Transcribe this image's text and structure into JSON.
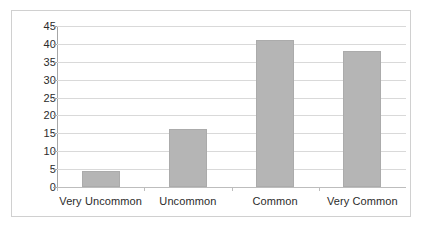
{
  "chart_data": {
    "type": "bar",
    "title": "",
    "subtitle": "",
    "xlabel": "",
    "ylabel": "",
    "categories": [
      "Very Uncommon",
      "Uncommon",
      "Common",
      "Very Common"
    ],
    "values": [
      4.5,
      16.3,
      41,
      38
    ],
    "series": [
      {
        "name": "Series 1",
        "values": [
          4.5,
          16.3,
          41,
          38
        ]
      }
    ],
    "ylim": [
      0,
      45
    ],
    "ytick_labels": [
      "45",
      "40",
      "35",
      "30",
      "25",
      "20",
      "15",
      "10",
      "5",
      "0"
    ],
    "ytick_values": [
      45,
      40,
      35,
      30,
      25,
      20,
      15,
      10,
      5,
      0
    ],
    "ytick_step": 5,
    "grid": true,
    "grid_axis": "y",
    "legend": false,
    "legend_position": "none",
    "bar_color": "#b5b5b5",
    "bar_border_color": "#ababab",
    "gridline_color": "#d9d9d9",
    "axis_color": "#a6a6a6",
    "frame_color": "#d0d0d0",
    "background_color": "#ffffff",
    "text_color": "#2b2b2b"
  }
}
